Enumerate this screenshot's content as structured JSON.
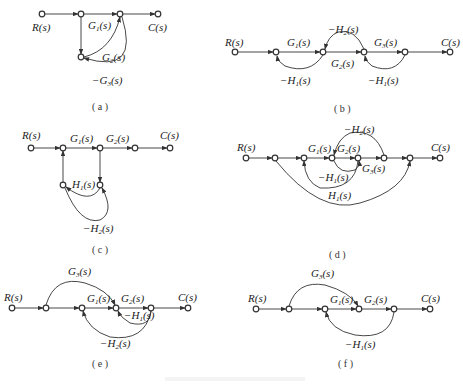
{
  "figure": {
    "bottom_caption": ""
  },
  "diagrams": {
    "a": {
      "caption": "( a )",
      "input": "R(s)",
      "output": "C(s)",
      "branches": [
        {
          "label": "G",
          "sub": "1",
          "tail": "(s)"
        },
        {
          "label": "G",
          "sub": "2",
          "tail": "(s)"
        },
        {
          "label": "−G",
          "sub": "3",
          "tail": "(s)"
        }
      ]
    },
    "b": {
      "caption": "( b )",
      "input": "R(s)",
      "output": "C(s)",
      "branches": [
        {
          "label": "G",
          "sub": "1",
          "tail": "(s)"
        },
        {
          "label": "−H",
          "sub": "2",
          "tail": "(s)"
        },
        {
          "label": "G",
          "sub": "2",
          "tail": "(s)"
        },
        {
          "label": "G",
          "sub": "3",
          "tail": "(s)"
        },
        {
          "label": "−H",
          "sub": "1",
          "tail": "(s)"
        },
        {
          "label": "−H",
          "sub": "1",
          "tail": "(s)"
        }
      ]
    },
    "c": {
      "caption": "( c )",
      "input": "R(s)",
      "output": "C(s)",
      "branches": [
        {
          "label": "G",
          "sub": "1",
          "tail": "(s)"
        },
        {
          "label": "G",
          "sub": "2",
          "tail": "(s)"
        },
        {
          "label": "H",
          "sub": "1",
          "tail": "(s)"
        },
        {
          "label": "−H",
          "sub": "2",
          "tail": "(s)"
        }
      ]
    },
    "d": {
      "caption": "( d )",
      "input": "R(s)",
      "output": "C(s)",
      "branches": [
        {
          "label": "−H",
          "sub": "2",
          "tail": "(s)"
        },
        {
          "label": "G",
          "sub": "1",
          "tail": "(s)"
        },
        {
          "label": "G",
          "sub": "2",
          "tail": "(s)"
        },
        {
          "label": "G",
          "sub": "3",
          "tail": "(s)"
        },
        {
          "label": "−H",
          "sub": "1",
          "tail": "(s)"
        },
        {
          "label": "H",
          "sub": "1",
          "tail": "(s)"
        }
      ]
    },
    "e": {
      "caption": "( e )",
      "input": "R(s)",
      "output": "C(s)",
      "branches": [
        {
          "label": "G",
          "sub": "3",
          "tail": "(s)"
        },
        {
          "label": "G",
          "sub": "1",
          "tail": "(s)"
        },
        {
          "label": "G",
          "sub": "2",
          "tail": "(s)"
        },
        {
          "label": "−H",
          "sub": "1",
          "tail": "(s)"
        },
        {
          "label": "−H",
          "sub": "2",
          "tail": "(s)"
        }
      ]
    },
    "f": {
      "caption": "( f )",
      "input": "R(s)",
      "output": "C(s)",
      "branches": [
        {
          "label": "G",
          "sub": "3",
          "tail": "(s)"
        },
        {
          "label": "G",
          "sub": "1",
          "tail": "(s)"
        },
        {
          "label": "G",
          "sub": "2",
          "tail": "(s)"
        },
        {
          "label": "−H",
          "sub": "1",
          "tail": "(s)"
        }
      ]
    }
  }
}
